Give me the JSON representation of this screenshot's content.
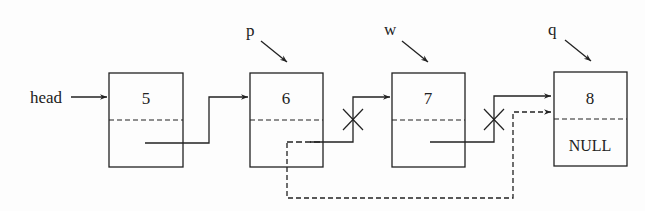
{
  "diagram": {
    "title": "",
    "type": "singly-linked-list-deletion",
    "head_label": "head",
    "nodes": [
      {
        "id": "n1",
        "value": "5",
        "next_label": "",
        "pointer_label": ""
      },
      {
        "id": "n2",
        "value": "6",
        "next_label": "",
        "pointer_label": "p"
      },
      {
        "id": "n3",
        "value": "7",
        "next_label": "",
        "pointer_label": "w"
      },
      {
        "id": "n4",
        "value": "8",
        "next_label": "NULL",
        "pointer_label": "q"
      }
    ],
    "edges": [
      {
        "from": "head",
        "to": "n1",
        "style": "solid",
        "removed": false
      },
      {
        "from": "n1",
        "to": "n2",
        "style": "solid",
        "removed": false
      },
      {
        "from": "n2",
        "to": "n3",
        "style": "solid",
        "removed": true
      },
      {
        "from": "n3",
        "to": "n4",
        "style": "solid",
        "removed": true
      },
      {
        "from": "n2",
        "to": "n4",
        "style": "dashed",
        "removed": false
      }
    ],
    "colors": {
      "stroke": "#222222",
      "background": "#fdfdfd"
    }
  }
}
